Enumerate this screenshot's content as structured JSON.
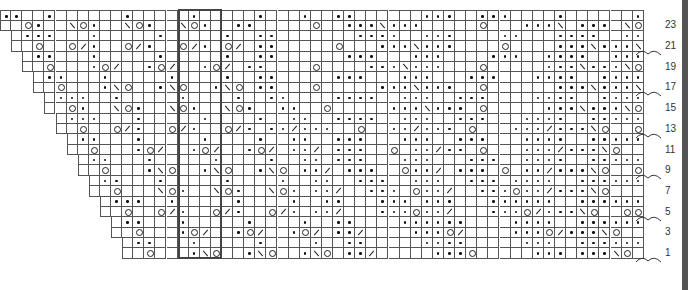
{
  "chart": {
    "columns": 58,
    "rows_count": 24,
    "legend": {
      ".": "purl-dot",
      "o": "yarn-over",
      "\\": "ssk",
      "/": "k2tog",
      " ": "knit"
    },
    "row_numbers": [
      "23",
      "21",
      "19",
      "17",
      "15",
      "13",
      "11",
      "9",
      "7",
      "5",
      "3",
      "1"
    ],
    "bracket_rows": [
      21,
      17,
      13,
      9,
      5,
      1
    ],
    "repeat_box": {
      "start_col": 16,
      "end_col": 19
    },
    "rows": [
      {
        "n": 24,
        "start": 0,
        "cells": "..  .      .     .     .   .  ..      ...  ...    .      ..  .  ........ "
      },
      {
        "n": 23,
        "start": 0,
        "cells": "  o.  \\o.  \\o.  \\o.  ..     o  ...\\...     o   ...\\ ... \\o      "
      },
      {
        "n": 22,
        "start": 1,
        "cells": " ...   .     .     .  ..       ....  ...    ..   ....  ....... ."
      },
      {
        "n": 21,
        "start": 1,
        "cells": "  o  o/.  o/.  o/. o/ ..     o   ...\\...    o    ...\\...\\o   oo"
      },
      {
        "n": 20,
        "start": 2,
        "cells": " ..   .     .     .  ..      ...   ...    ...  ....  ........"
      },
      {
        "n": 19,
        "start": 2,
        "cells": "  o   .o/  .o/  .o/ ..    o    ...\\...   o     ...\\...\\o    "
      },
      {
        "n": 18,
        "start": 3,
        "cells": " ..   .     .    .  ..     ...   ...   ...   ....  ...... ."
      },
      {
        "n": 17,
        "start": 3,
        "cells": "  o   .\\o  .\\o  .\\o ..   o     ...\\...  o      ...\\...\\o  oo"
      },
      {
        "n": 16,
        "start": 4,
        "cells": " ...  .     .    .  ..    ....  ...  ...    ....  ......."
      },
      {
        "n": 15,
        "start": 4,
        "cells": "  o.  \\o.  \\o.  \\o.  ..  o     ...\\... o     ...\\...\\o   "
      },
      {
        "n": 14,
        "start": 5,
        "cells": " ...   .     .    .  ..  ....  ...  ...   ....  ...... ."
      },
      {
        "n": 13,
        "start": 5,
        "cells": "  o  o/.  o/.  o/. ../...  o  ../... o   .../...\\o  oo"
      },
      {
        "n": 12,
        "start": 6,
        "cells": " ..   .     .    .  ..  ...   ...  ...   ....  ......."
      },
      {
        "n": 11,
        "start": 6,
        "cells": "  o   .o/  .o/  .o/ ../ ...  o ../.. o   .../...\\o   "
      },
      {
        "n": 10,
        "start": 7,
        "cells": " ..   .     .    .  .. ...   ...   ...  ....  ...... ."
      },
      {
        "n": 9,
        "start": 7,
        "cells": "  o   .\\o  .\\o  .\\o ../ ...  o../ ... o ../...\\o  oo"
      },
      {
        "n": 8,
        "start": 8,
        "cells": " ..   .     .    .  ..  ...  ...  ... ....  ......."
      },
      {
        "n": 7,
        "start": 8,
        "cells": "  o   \\o.  \\o.  \\o. ../  ... o../  ...o../...\\o   "
      },
      {
        "n": 6,
        "start": 9,
        "cells": " ...  .     .    .  ..   ... ...   ......  ...... ."
      },
      {
        "n": 5,
        "start": 9,
        "cells": "  o  o/.  o/.  o/. ../   ...o../   ...o/...\\o  oo"
      },
      {
        "n": 4,
        "start": 10,
        "cells": " ..   .     .    .  ..    ......    ....  ......."
      },
      {
        "n": 3,
        "start": 10,
        "cells": "  o   .o/  .o/  .o/ ../    ...o/    ...o/...\\o   "
      },
      {
        "n": 2,
        "start": 11,
        "cells": " ..   .     .    .  ..     ....     ...  ...... ."
      },
      {
        "n": 1,
        "start": 11,
        "cells": "  o   .\\o  .\\o  .\\o ../     ...o     ... ...\\o  oo"
      }
    ]
  }
}
